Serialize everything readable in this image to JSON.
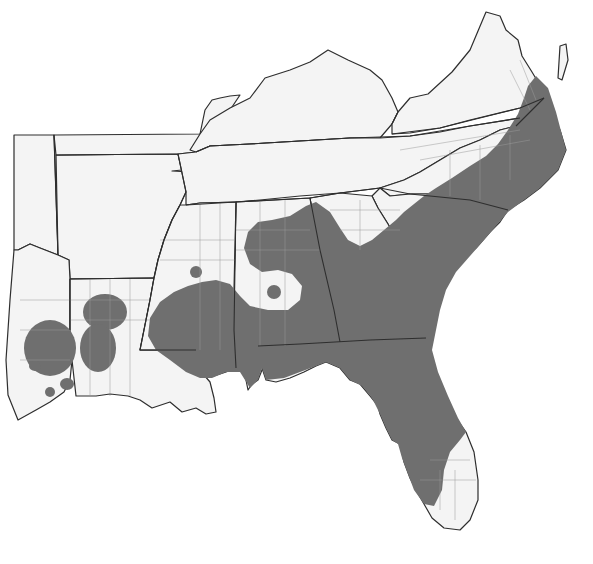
{
  "map": {
    "type": "range-map",
    "region": "Southeastern United States",
    "colors": {
      "background": "#ffffff",
      "land": "#f4f4f4",
      "range_fill": "#6f6f6f",
      "state_border": "#2e2e2e",
      "county_border": "#9a9a9a"
    },
    "states_shown": [
      "Oklahoma",
      "Texas",
      "Arkansas",
      "Louisiana",
      "Missouri",
      "Kentucky",
      "Tennessee",
      "Mississippi",
      "Alabama",
      "Georgia",
      "Florida",
      "South Carolina",
      "North Carolina",
      "Virginia",
      "West Virginia",
      "Maryland",
      "Delaware"
    ],
    "shaded_range_description": "Coastal plain of VA, NC, SC, GA, FL (north/central), AL, MS, LA with isolated patches in LA/TX"
  }
}
